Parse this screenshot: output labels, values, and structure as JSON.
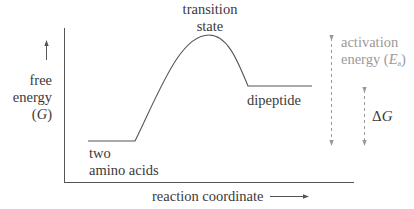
{
  "labels": {
    "transition_state": [
      "transition",
      "state"
    ],
    "y_axis": [
      "free",
      "energy",
      "(G)"
    ],
    "reactants": [
      "two",
      "amino acids"
    ],
    "product": "dipeptide",
    "x_axis": "reaction coordinate",
    "activation_energy": [
      "activation",
      "energy (",
      "E",
      "a",
      ")"
    ],
    "delta_g": [
      "Δ",
      "G"
    ]
  },
  "colors": {
    "curve": "#555555",
    "axes": "#555555",
    "annotation": "#9a9a9a",
    "text": "#3a3a3a"
  },
  "relative_energies": {
    "reactants": 0,
    "transition_state": 1,
    "product": 0.52
  }
}
